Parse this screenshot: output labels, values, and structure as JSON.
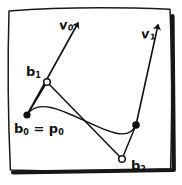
{
  "figure": {
    "background_color": "#ffffff",
    "ink_color": "#111111",
    "frame": {
      "name": "hand-drawn-border",
      "style": "hand-drawn rectangle with drop shadow on right and bottom edges"
    },
    "labels": {
      "v0": "v",
      "v0_sub": "0",
      "v1": "v",
      "v1_sub": "1",
      "b1": "b",
      "b1_sub": "1",
      "b0": "b",
      "b0_sub": "0",
      "b0_eq": " = p",
      "b0_eq_sub": "0",
      "b2": "b",
      "b2_sub": "2"
    },
    "points": [
      {
        "name": "b0",
        "label": "b₀ = p₀",
        "x": 27,
        "y": 115,
        "marker": "filled-dot"
      },
      {
        "name": "b1",
        "label": "b₁",
        "x": 47,
        "y": 82,
        "marker": "hollow-circle"
      },
      {
        "name": "b2",
        "label": "b₂",
        "x": 122,
        "y": 159,
        "marker": "hollow-circle"
      },
      {
        "name": "p1",
        "label": "",
        "x": 136,
        "y": 125,
        "marker": "filled-dot"
      }
    ],
    "vectors": [
      {
        "name": "v0",
        "from_x": 27,
        "from_y": 115,
        "tip_x": 79,
        "tip_y": 21,
        "label": "v₀"
      },
      {
        "name": "v1",
        "from_x": 136,
        "from_y": 125,
        "tip_x": 159,
        "tip_y": 22,
        "label": "v₁"
      }
    ],
    "control_polygon": [
      {
        "x": 27,
        "y": 115
      },
      {
        "x": 47,
        "y": 82
      },
      {
        "x": 122,
        "y": 159
      },
      {
        "x": 136,
        "y": 125
      }
    ],
    "curve": {
      "type": "cubic-bezier",
      "p0": {
        "x": 27,
        "y": 115
      },
      "c1": {
        "x": 47,
        "y": 82
      },
      "c2": {
        "x": 122,
        "y": 159
      },
      "p1": {
        "x": 136,
        "y": 125
      }
    }
  }
}
